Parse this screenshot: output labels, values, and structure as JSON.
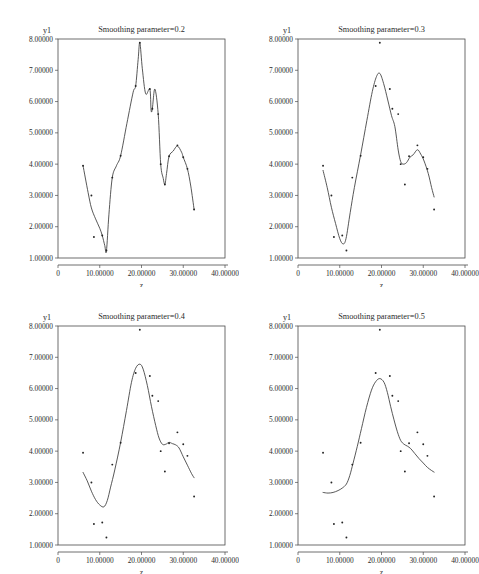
{
  "figure": {
    "width": 479,
    "height": 574,
    "background": "#ffffff",
    "ink": "#2b2b2b"
  },
  "chart_data": [
    {
      "type": "scatter",
      "panel_index": 0,
      "title": "Smoothing parameter=0.2",
      "xlabel": "z",
      "ylabel": "y1",
      "xlim": [
        0,
        40
      ],
      "ylim": [
        1,
        8
      ],
      "grid": false,
      "legend": "none",
      "xticks": [
        0,
        10,
        20,
        30,
        40
      ],
      "xticklabels": [
        "0",
        "10.00000",
        "20.00000",
        "30.00000",
        "40.00000"
      ],
      "yticks": [
        1,
        2,
        3,
        4,
        5,
        6,
        7,
        8
      ],
      "yticklabels": [
        "1.00000",
        "2.00000",
        "3.00000",
        "4.00000",
        "5.00000",
        "6.00000",
        "7.00000",
        "8.00000"
      ],
      "smoothing_parameter": 0.2,
      "x": [
        6.0,
        8.0,
        8.6,
        10.6,
        11.6,
        13.0,
        15.0,
        18.6,
        19.6,
        22.0,
        22.6,
        24.0,
        24.6,
        25.6,
        26.6,
        28.6,
        30.0,
        31.0,
        32.6
      ],
      "y": [
        3.95,
        3.0,
        1.67,
        1.72,
        1.24,
        3.57,
        4.27,
        6.5,
        7.88,
        6.4,
        5.77,
        5.6,
        4.0,
        3.35,
        4.25,
        4.6,
        4.22,
        3.85,
        2.55
      ],
      "smooth_x": [
        6.0,
        7.2,
        8.0,
        9.0,
        10.0,
        10.6,
        11.2,
        11.6,
        12.2,
        13.0,
        14.0,
        15.0,
        16.5,
        18.0,
        18.6,
        19.2,
        19.6,
        20.2,
        21.0,
        22.0,
        22.3,
        22.6,
        23.2,
        24.0,
        24.6,
        25.2,
        25.6,
        26.0,
        26.6,
        27.6,
        28.6,
        29.6,
        30.0,
        31.0,
        31.8,
        32.6
      ],
      "smooth_y": [
        3.95,
        3.1,
        2.6,
        2.25,
        1.95,
        1.72,
        1.4,
        1.22,
        2.4,
        3.57,
        3.95,
        4.27,
        5.3,
        6.3,
        6.5,
        7.35,
        7.88,
        7.05,
        6.25,
        6.4,
        5.72,
        5.78,
        6.4,
        5.6,
        4.0,
        3.55,
        3.35,
        3.7,
        4.25,
        4.42,
        4.58,
        4.38,
        4.22,
        3.85,
        3.3,
        2.55
      ]
    },
    {
      "type": "scatter",
      "panel_index": 1,
      "title": "Smoothing parameter=0.3",
      "xlabel": "z",
      "ylabel": "y1",
      "xlim": [
        0,
        40
      ],
      "ylim": [
        1,
        8
      ],
      "grid": false,
      "legend": "none",
      "xticks": [
        0,
        10,
        20,
        30,
        40
      ],
      "xticklabels": [
        "0",
        "10.00000",
        "20.00000",
        "30.00000",
        "40.00000"
      ],
      "yticks": [
        1,
        2,
        3,
        4,
        5,
        6,
        7,
        8
      ],
      "yticklabels": [
        "1.00000",
        "2.00000",
        "3.00000",
        "4.00000",
        "5.00000",
        "6.00000",
        "7.00000",
        "8.00000"
      ],
      "smoothing_parameter": 0.3,
      "x": [
        6.0,
        8.0,
        8.6,
        10.6,
        11.6,
        13.0,
        15.0,
        18.6,
        19.6,
        22.0,
        22.6,
        24.0,
        24.6,
        25.6,
        26.6,
        28.6,
        30.0,
        31.0,
        32.6
      ],
      "y": [
        3.95,
        3.0,
        1.67,
        1.72,
        1.24,
        3.57,
        4.27,
        6.5,
        7.88,
        6.4,
        5.77,
        5.6,
        4.0,
        3.35,
        4.25,
        4.6,
        4.22,
        3.85,
        2.55
      ],
      "smooth_x": [
        6.0,
        7.0,
        8.0,
        9.0,
        10.0,
        10.8,
        11.5,
        12.5,
        13.5,
        15.0,
        16.5,
        17.8,
        18.8,
        19.6,
        20.5,
        21.5,
        22.4,
        23.2,
        24.0,
        24.6,
        25.2,
        26.0,
        26.8,
        27.6,
        28.6,
        29.4,
        30.2,
        31.2,
        32.0,
        32.6
      ],
      "smooth_y": [
        3.8,
        3.25,
        2.62,
        2.1,
        1.62,
        1.45,
        1.62,
        2.45,
        3.25,
        4.3,
        5.4,
        6.32,
        6.8,
        6.9,
        6.58,
        6.05,
        5.55,
        5.2,
        4.45,
        4.08,
        4.0,
        4.05,
        4.22,
        4.3,
        4.46,
        4.32,
        4.1,
        3.7,
        3.25,
        2.95
      ]
    },
    {
      "type": "scatter",
      "panel_index": 2,
      "title": "Smoothing parameter=0.4",
      "xlabel": "z",
      "ylabel": "y1",
      "xlim": [
        0,
        40
      ],
      "ylim": [
        1,
        8
      ],
      "grid": false,
      "legend": "none",
      "xticks": [
        0,
        10,
        20,
        30,
        40
      ],
      "xticklabels": [
        "0",
        "10.00000",
        "20.00000",
        "30.00000",
        "40.00000"
      ],
      "yticks": [
        1,
        2,
        3,
        4,
        5,
        6,
        7,
        8
      ],
      "yticklabels": [
        "1.00000",
        "2.00000",
        "3.00000",
        "4.00000",
        "5.00000",
        "6.00000",
        "7.00000",
        "8.00000"
      ],
      "smoothing_parameter": 0.4,
      "x": [
        6.0,
        8.0,
        8.6,
        10.6,
        11.6,
        13.0,
        15.0,
        18.6,
        19.6,
        22.0,
        22.6,
        24.0,
        24.6,
        25.6,
        26.6,
        28.6,
        30.0,
        31.0,
        32.6
      ],
      "y": [
        3.95,
        3.0,
        1.67,
        1.72,
        1.24,
        3.57,
        4.27,
        6.5,
        7.88,
        6.4,
        5.77,
        5.6,
        4.0,
        3.35,
        4.25,
        4.6,
        4.22,
        3.85,
        2.55
      ],
      "smooth_x": [
        6.0,
        7.0,
        8.0,
        9.0,
        10.0,
        11.0,
        11.8,
        12.6,
        13.6,
        15.0,
        16.4,
        17.6,
        18.6,
        19.6,
        20.4,
        21.4,
        22.4,
        23.4,
        24.2,
        25.0,
        25.8,
        26.6,
        27.4,
        28.2,
        29.0,
        30.0,
        31.0,
        32.0,
        32.6
      ],
      "smooth_y": [
        3.32,
        3.05,
        2.72,
        2.45,
        2.28,
        2.22,
        2.42,
        2.85,
        3.4,
        4.28,
        5.3,
        6.2,
        6.65,
        6.78,
        6.62,
        6.1,
        5.42,
        4.82,
        4.42,
        4.22,
        4.22,
        4.28,
        4.24,
        4.2,
        4.1,
        3.82,
        3.55,
        3.28,
        3.15
      ]
    },
    {
      "type": "scatter",
      "panel_index": 3,
      "title": "Smoothing parameter=0.5",
      "xlabel": "z",
      "ylabel": "y1",
      "xlim": [
        0,
        40
      ],
      "ylim": [
        1,
        8
      ],
      "grid": false,
      "legend": "none",
      "xticks": [
        0,
        10,
        20,
        30,
        40
      ],
      "xticklabels": [
        "0",
        "10.00000",
        "20.00000",
        "30.00000",
        "40.00000"
      ],
      "yticks": [
        1,
        2,
        3,
        4,
        5,
        6,
        7,
        8
      ],
      "yticklabels": [
        "1.00000",
        "2.00000",
        "3.00000",
        "4.00000",
        "5.00000",
        "6.00000",
        "7.00000",
        "8.00000"
      ],
      "smoothing_parameter": 0.5,
      "x": [
        6.0,
        8.0,
        8.6,
        10.6,
        11.6,
        13.0,
        15.0,
        18.6,
        19.6,
        22.0,
        22.6,
        24.0,
        24.6,
        25.6,
        26.6,
        28.6,
        30.0,
        31.0,
        32.6
      ],
      "y": [
        3.95,
        3.0,
        1.67,
        1.72,
        1.24,
        3.57,
        4.27,
        6.5,
        7.88,
        6.4,
        5.77,
        5.6,
        4.0,
        3.35,
        4.25,
        4.6,
        4.22,
        3.85,
        2.55
      ],
      "smooth_x": [
        6.0,
        7.2,
        8.4,
        9.6,
        10.6,
        11.6,
        12.4,
        13.2,
        14.2,
        15.2,
        16.4,
        17.6,
        18.6,
        19.6,
        20.6,
        21.4,
        22.2,
        23.0,
        23.8,
        24.6,
        25.4,
        26.2,
        27.0,
        28.0,
        29.0,
        30.0,
        31.0,
        32.0,
        32.6
      ],
      "smooth_y": [
        2.68,
        2.66,
        2.68,
        2.74,
        2.82,
        2.95,
        3.22,
        3.62,
        4.15,
        4.72,
        5.4,
        5.95,
        6.22,
        6.32,
        6.2,
        5.88,
        5.42,
        5.0,
        4.62,
        4.34,
        4.22,
        4.16,
        4.08,
        3.92,
        3.76,
        3.62,
        3.48,
        3.38,
        3.33
      ]
    }
  ]
}
